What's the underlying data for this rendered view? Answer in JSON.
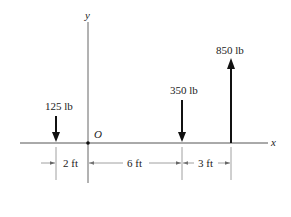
{
  "diagram": {
    "axes": {
      "x_label": "x",
      "y_label": "y",
      "origin_label": "O"
    },
    "forces": [
      {
        "label": "125 lb",
        "direction": "down",
        "position_ft": -2
      },
      {
        "label": "350 lb",
        "direction": "down",
        "position_ft": 6
      },
      {
        "label": "850 lb",
        "direction": "up",
        "position_ft": 9
      }
    ],
    "dimensions": [
      {
        "label": "2 ft"
      },
      {
        "label": "6 ft"
      },
      {
        "label": "3 ft"
      }
    ],
    "colors": {
      "axis": "#555555",
      "force": "#111111",
      "dimension": "#777777"
    }
  }
}
